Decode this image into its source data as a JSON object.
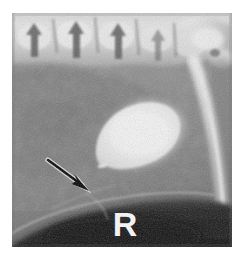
{
  "image": {
    "modality": "radiograph",
    "view": "lateral abdomen",
    "side_marker": "R",
    "plate": {
      "left": 12,
      "top": 13,
      "width": 220,
      "height": 234,
      "background_hex": "#8a8a8a",
      "border_hex": "#ffffff"
    }
  },
  "annotations": {
    "arrow": {
      "label": "arrow-annotation",
      "color_hex": "#000000",
      "outline_hex": "#ffffff",
      "tail_x": 36,
      "tail_y": 147,
      "tip_x": 74,
      "tip_y": 176
    },
    "side_marker": {
      "label": "R",
      "color_hex": "#f2f2f2",
      "x": 108,
      "y": 204
    }
  },
  "anatomy": [
    {
      "name": "lumbar-vertebrae",
      "tone_hex": "#dcdcdc",
      "region": "top"
    },
    {
      "name": "spinous-processes",
      "tone_hex": "#5e5e5e",
      "region": "top"
    },
    {
      "name": "sacrum-pelvis",
      "tone_hex": "#e2e2e2",
      "region": "top-right"
    },
    {
      "name": "femur",
      "tone_hex": "#d6d6d6",
      "region": "right"
    },
    {
      "name": "contrast-filled-bladder",
      "tone_hex": "#ededed",
      "region": "center"
    },
    {
      "name": "soft-tissue-abdomen",
      "tone_hex": "#858585",
      "region": "left"
    },
    {
      "name": "gas-filled-colon",
      "tone_hex": "#191919",
      "region": "bottom"
    },
    {
      "name": "ventral-body-wall",
      "tone_hex": "#9a9a9a",
      "region": "bottom-left"
    }
  ],
  "colors": {
    "bone_bright": "#e6e6e6",
    "bladder_bright": "#ededed",
    "soft_tissue_mid": "#8a8a8a",
    "soft_tissue_dark": "#6e6e6e",
    "gas_dark": "#161616",
    "marker_white": "#f2f2f2",
    "page_background": "#ffffff"
  }
}
